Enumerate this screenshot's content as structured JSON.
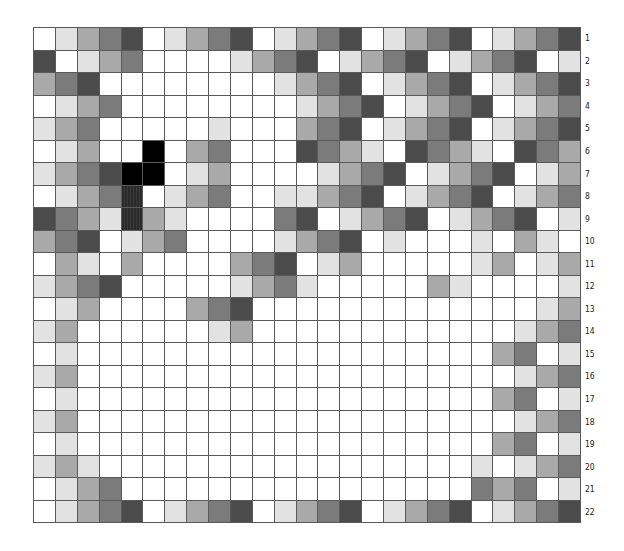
{
  "figure": {
    "columns": 25,
    "rows": 22,
    "row_labels": [
      "1",
      "2",
      "3",
      "4",
      "5",
      "6",
      "7",
      "8",
      "9",
      "10",
      "11",
      "12",
      "13",
      "14",
      "15",
      "16",
      "17",
      "18",
      "19",
      "20",
      "21",
      "22"
    ],
    "shade_legend": {
      "0": "#ffffff",
      "1": "#e2e2e2",
      "2": "#a9a9a9",
      "3": "#7b7b7b",
      "4": "#4b4b4b",
      "5": "#000000",
      "6": "#2a2a2a (hatched)"
    },
    "grid_line_color": "#5a5a5a",
    "cells": [
      [
        0,
        1,
        2,
        3,
        4,
        0,
        1,
        2,
        3,
        4,
        0,
        1,
        2,
        3,
        4,
        0,
        1,
        2,
        3,
        4,
        0,
        1,
        2,
        3,
        4
      ],
      [
        4,
        0,
        1,
        2,
        3,
        0,
        0,
        0,
        0,
        1,
        2,
        3,
        4,
        0,
        1,
        2,
        3,
        4,
        0,
        1,
        2,
        3,
        4,
        0,
        1
      ],
      [
        2,
        3,
        4,
        0,
        0,
        0,
        0,
        0,
        0,
        0,
        0,
        1,
        2,
        3,
        4,
        0,
        1,
        2,
        3,
        4,
        0,
        1,
        2,
        3,
        4
      ],
      [
        0,
        1,
        2,
        3,
        0,
        0,
        0,
        0,
        0,
        0,
        0,
        0,
        1,
        2,
        3,
        4,
        0,
        1,
        2,
        3,
        4,
        0,
        1,
        2,
        3
      ],
      [
        1,
        2,
        3,
        0,
        0,
        0,
        0,
        0,
        1,
        0,
        0,
        0,
        2,
        3,
        4,
        0,
        1,
        2,
        3,
        4,
        0,
        1,
        2,
        3,
        4
      ],
      [
        0,
        1,
        2,
        0,
        0,
        5,
        0,
        2,
        3,
        0,
        0,
        0,
        4,
        3,
        2,
        1,
        0,
        4,
        3,
        2,
        1,
        0,
        4,
        3,
        2
      ],
      [
        1,
        2,
        3,
        4,
        5,
        5,
        0,
        1,
        2,
        0,
        0,
        0,
        0,
        1,
        2,
        3,
        4,
        0,
        1,
        2,
        3,
        4,
        0,
        1,
        2
      ],
      [
        0,
        1,
        2,
        3,
        6,
        0,
        1,
        2,
        3,
        0,
        0,
        1,
        1,
        2,
        3,
        4,
        0,
        1,
        2,
        3,
        4,
        0,
        1,
        2,
        3
      ],
      [
        4,
        3,
        2,
        1,
        6,
        2,
        1,
        0,
        0,
        0,
        0,
        3,
        4,
        0,
        1,
        2,
        3,
        4,
        0,
        1,
        2,
        3,
        4,
        0,
        1
      ],
      [
        2,
        3,
        4,
        0,
        1,
        2,
        3,
        0,
        0,
        0,
        0,
        1,
        2,
        3,
        4,
        0,
        1,
        0,
        0,
        0,
        1,
        0,
        2,
        1,
        0
      ],
      [
        0,
        2,
        1,
        0,
        2,
        0,
        0,
        0,
        0,
        2,
        3,
        4,
        0,
        1,
        2,
        0,
        0,
        0,
        0,
        0,
        1,
        2,
        0,
        1,
        2
      ],
      [
        1,
        2,
        3,
        4,
        0,
        0,
        0,
        0,
        0,
        1,
        2,
        3,
        1,
        0,
        0,
        0,
        0,
        0,
        2,
        1,
        0,
        0,
        0,
        0,
        1
      ],
      [
        0,
        1,
        2,
        0,
        0,
        0,
        0,
        2,
        3,
        4,
        0,
        0,
        0,
        0,
        0,
        0,
        0,
        0,
        0,
        0,
        0,
        0,
        0,
        1,
        2
      ],
      [
        1,
        2,
        0,
        0,
        0,
        0,
        0,
        0,
        1,
        2,
        0,
        0,
        0,
        0,
        0,
        0,
        0,
        0,
        0,
        0,
        0,
        0,
        1,
        2,
        3
      ],
      [
        0,
        1,
        0,
        0,
        0,
        0,
        0,
        0,
        0,
        0,
        0,
        0,
        0,
        0,
        0,
        0,
        0,
        0,
        0,
        0,
        0,
        2,
        3,
        0,
        1
      ],
      [
        1,
        2,
        0,
        0,
        0,
        0,
        0,
        0,
        0,
        0,
        0,
        0,
        0,
        0,
        0,
        0,
        0,
        0,
        0,
        0,
        0,
        0,
        1,
        2,
        3
      ],
      [
        0,
        1,
        0,
        0,
        0,
        0,
        0,
        0,
        0,
        0,
        0,
        0,
        0,
        0,
        0,
        0,
        0,
        0,
        0,
        0,
        0,
        2,
        3,
        0,
        1
      ],
      [
        1,
        2,
        0,
        0,
        0,
        0,
        0,
        0,
        0,
        0,
        0,
        0,
        0,
        0,
        0,
        0,
        0,
        0,
        0,
        0,
        0,
        0,
        1,
        2,
        3
      ],
      [
        0,
        1,
        0,
        0,
        0,
        0,
        0,
        0,
        0,
        0,
        0,
        0,
        0,
        0,
        0,
        0,
        0,
        0,
        0,
        0,
        0,
        2,
        3,
        0,
        1
      ],
      [
        1,
        2,
        1,
        0,
        0,
        0,
        0,
        0,
        0,
        0,
        0,
        0,
        0,
        0,
        0,
        0,
        0,
        0,
        0,
        0,
        1,
        0,
        1,
        2,
        3
      ],
      [
        0,
        1,
        2,
        3,
        0,
        0,
        0,
        0,
        0,
        0,
        0,
        0,
        0,
        0,
        0,
        0,
        0,
        0,
        0,
        0,
        3,
        2,
        3,
        0,
        1
      ],
      [
        0,
        1,
        2,
        3,
        4,
        0,
        1,
        2,
        3,
        4,
        0,
        1,
        2,
        3,
        4,
        0,
        1,
        2,
        3,
        4,
        0,
        1,
        2,
        3,
        4
      ]
    ]
  }
}
